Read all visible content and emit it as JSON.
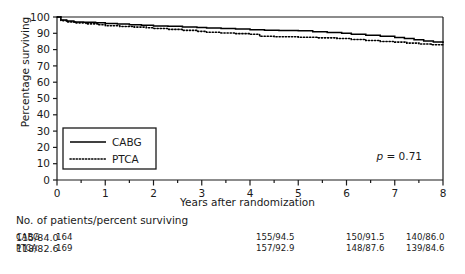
{
  "chart_data": {
    "type": "line",
    "title": "",
    "xlabel": "Years after randomization",
    "ylabel": "Percentage surviving",
    "xlim": [
      0,
      8
    ],
    "ylim": [
      0,
      100
    ],
    "xticks": [
      0,
      1,
      2,
      3,
      4,
      5,
      6,
      7,
      8
    ],
    "yticks": [
      0,
      10,
      20,
      30,
      40,
      50,
      60,
      70,
      80,
      90,
      100
    ],
    "xtick_labels": [
      "0",
      "1",
      "2",
      "3",
      "4",
      "5",
      "6",
      "7",
      "8"
    ],
    "ytick_labels": [
      "0",
      "10",
      "20",
      "30",
      "40",
      "50",
      "60",
      "70",
      "80",
      "90",
      "100"
    ],
    "minor_xticks": [
      0.5,
      1.5,
      2.5,
      3.5,
      4.5,
      5.5,
      6.5,
      7.5
    ],
    "grid": false,
    "legend_position": "lower-left-inside",
    "annotation": "p = 0.71",
    "annotation_p_symbol": "p",
    "annotation_p_value": "= 0.71",
    "series": [
      {
        "name": "CABG",
        "style": "solid",
        "color": "#000000",
        "points": [
          [
            0.0,
            100.0
          ],
          [
            0.08,
            98.2
          ],
          [
            0.2,
            97.6
          ],
          [
            0.35,
            97.0
          ],
          [
            0.55,
            96.8
          ],
          [
            0.8,
            96.4
          ],
          [
            1.0,
            96.0
          ],
          [
            1.25,
            95.7
          ],
          [
            1.5,
            95.2
          ],
          [
            1.75,
            95.0
          ],
          [
            2.0,
            94.5
          ],
          [
            2.3,
            94.3
          ],
          [
            2.6,
            93.9
          ],
          [
            2.9,
            93.5
          ],
          [
            3.1,
            93.2
          ],
          [
            3.4,
            93.0
          ],
          [
            3.7,
            92.6
          ],
          [
            4.0,
            92.2
          ],
          [
            4.3,
            91.9
          ],
          [
            4.6,
            91.7
          ],
          [
            5.0,
            91.5
          ],
          [
            5.3,
            91.0
          ],
          [
            5.6,
            90.5
          ],
          [
            5.9,
            90.0
          ],
          [
            6.1,
            89.4
          ],
          [
            6.4,
            88.8
          ],
          [
            6.7,
            88.2
          ],
          [
            7.0,
            87.4
          ],
          [
            7.2,
            86.8
          ],
          [
            7.4,
            86.0
          ],
          [
            7.6,
            85.2
          ],
          [
            7.8,
            84.6
          ],
          [
            8.0,
            84.0
          ]
        ]
      },
      {
        "name": "PTCA",
        "style": "dotted",
        "color": "#000000",
        "points": [
          [
            0.0,
            100.0
          ],
          [
            0.08,
            97.8
          ],
          [
            0.22,
            97.0
          ],
          [
            0.4,
            96.4
          ],
          [
            0.6,
            95.8
          ],
          [
            0.85,
            95.2
          ],
          [
            1.0,
            94.6
          ],
          [
            1.3,
            94.2
          ],
          [
            1.6,
            93.8
          ],
          [
            1.85,
            93.4
          ],
          [
            2.0,
            92.9
          ],
          [
            2.3,
            92.4
          ],
          [
            2.6,
            91.8
          ],
          [
            2.9,
            91.2
          ],
          [
            3.1,
            90.6
          ],
          [
            3.4,
            90.2
          ],
          [
            3.7,
            89.8
          ],
          [
            4.0,
            89.4
          ],
          [
            4.2,
            88.2
          ],
          [
            4.5,
            87.9
          ],
          [
            5.0,
            87.6
          ],
          [
            5.4,
            87.2
          ],
          [
            5.8,
            86.8
          ],
          [
            6.1,
            86.2
          ],
          [
            6.4,
            85.6
          ],
          [
            6.7,
            85.0
          ],
          [
            7.0,
            84.6
          ],
          [
            7.25,
            84.0
          ],
          [
            7.5,
            83.4
          ],
          [
            7.75,
            83.0
          ],
          [
            8.0,
            82.6
          ]
        ]
      }
    ]
  },
  "legend": {
    "items": [
      {
        "label": "CABG",
        "style": "solid"
      },
      {
        "label": "PTCA",
        "style": "dotted"
      }
    ]
  },
  "risk_table": {
    "title": "No. of patients/percent surviving",
    "rows": [
      {
        "label": "CABG",
        "values": [
          "164",
          "",
          "155/94.5",
          "150/91.5",
          "140/86.0",
          "115/84.0"
        ]
      },
      {
        "label": "PTCA",
        "values": [
          "169",
          "",
          "157/92.9",
          "148/87.6",
          "139/84.6",
          "118/82.6"
        ]
      }
    ]
  }
}
